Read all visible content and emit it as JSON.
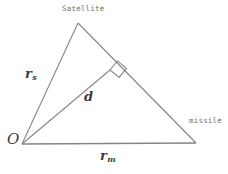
{
  "figure": {
    "type": "geometry-diagram",
    "width": 228,
    "height": 174,
    "background_color": "#ffffff",
    "line_color": "#808080",
    "label_color": "#6e6e6e"
  },
  "labels": {
    "satellite": "Satellite",
    "missile": "missile",
    "origin": "O",
    "r_s_base": "r",
    "r_s_sub": "s",
    "d": "d",
    "r_m_base": "r",
    "r_m_sub": "m"
  },
  "geometry": {
    "points": {
      "origin": [
        22,
        144
      ],
      "satellite": [
        78,
        23
      ],
      "missile": [
        196,
        143
      ],
      "perpendicular_foot": [
        110,
        70
      ]
    },
    "segments": [
      {
        "name": "r_s",
        "from": "origin",
        "to": "satellite"
      },
      {
        "name": "satellite-missile",
        "from": "satellite",
        "to": "missile"
      },
      {
        "name": "r_m",
        "from": "origin",
        "to": "missile"
      },
      {
        "name": "d",
        "from": "origin",
        "to": "perpendicular_foot"
      }
    ],
    "right_angle": {
      "at": "perpendicular_foot",
      "marker": "square",
      "size": 11
    }
  }
}
